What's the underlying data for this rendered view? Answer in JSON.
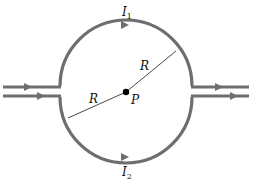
{
  "diagram": {
    "type": "circuit-loop",
    "colors": {
      "wire": "#6e6e6e",
      "radius_line": "#333333",
      "point": "#000000",
      "background": "#ffffff"
    },
    "labels": {
      "current_top": {
        "symbol": "I",
        "subscript": "1"
      },
      "current_bottom": {
        "symbol": "I",
        "subscript": "2"
      },
      "radius_upper": "R",
      "radius_lower": "R",
      "center_point": "P"
    },
    "elements": {
      "loop": "circle of radius R with current split into two semicircular paths",
      "input_wires": "two parallel straight wires entering from left with rightward arrows",
      "output_wires": "two parallel straight wires exiting to right with rightward arrows",
      "center": "point P at circle center"
    }
  }
}
